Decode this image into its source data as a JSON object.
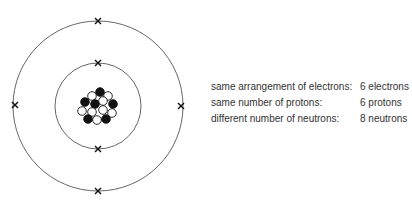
{
  "diagram": {
    "electrons": {
      "inner_shell": 2,
      "outer_shell": 4,
      "symbol": "x-cross"
    },
    "nucleus": {
      "protons": 6,
      "neutrons": 8,
      "proton_color": "#111111",
      "neutron_color": "#ffffff"
    },
    "orbit_color": "#555555"
  },
  "legend": {
    "rows": [
      {
        "label": "same arrangement of electrons:",
        "value": "6 electrons"
      },
      {
        "label": "same number of protons:",
        "value": "6 protons"
      },
      {
        "label": "different number of neutrons:",
        "value": "8 neutrons"
      }
    ]
  }
}
